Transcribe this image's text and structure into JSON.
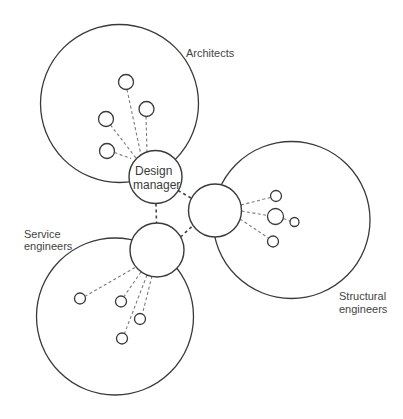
{
  "diagram": {
    "colors": {
      "stroke": "#3a3a3a",
      "dash": "#7a7a7a",
      "text": "#444444",
      "background": "#ffffff"
    },
    "groups": [
      {
        "id": "architects",
        "label_lines": [
          "Architects"
        ],
        "circle": {
          "cx": 119.5,
          "cy": 103.5,
          "r": 79
        },
        "members": [
          {
            "cx": 126,
            "cy": 82,
            "r": 7.5
          },
          {
            "cx": 146.5,
            "cy": 109,
            "r": 7.5
          },
          {
            "cx": 106,
            "cy": 119,
            "r": 7.5
          },
          {
            "cx": 107,
            "cy": 151,
            "r": 7.5
          }
        ]
      },
      {
        "id": "structural-engineers",
        "label_lines": [
          "Structural",
          "engineers"
        ],
        "circle": {
          "cx": 291.5,
          "cy": 220,
          "r": 78.5
        },
        "members": [
          {
            "cx": 276,
            "cy": 196,
            "r": 5.5
          },
          {
            "cx": 275.5,
            "cy": 216.5,
            "r": 8
          },
          {
            "cx": 294.5,
            "cy": 222,
            "r": 4.5
          },
          {
            "cx": 273,
            "cy": 241.5,
            "r": 5.5
          }
        ]
      },
      {
        "id": "service-engineers",
        "label_lines": [
          "Service",
          "engineers"
        ],
        "circle": {
          "cx": 115,
          "cy": 316.5,
          "r": 78.5
        },
        "members": [
          {
            "cx": 80,
            "cy": 298.5,
            "r": 5.5
          },
          {
            "cx": 121,
            "cy": 301.5,
            "r": 5.5
          },
          {
            "cx": 140,
            "cy": 319,
            "r": 5.5
          },
          {
            "cx": 122,
            "cy": 338.5,
            "r": 5.5
          }
        ]
      }
    ],
    "hubs": [
      {
        "id": "design-manager",
        "label_lines": [
          "Design",
          "manager"
        ],
        "cx": 155.5,
        "cy": 177,
        "r": 26.5
      },
      {
        "id": "structural-hub",
        "label_lines": [],
        "cx": 215,
        "cy": 210.5,
        "r": 26.5
      },
      {
        "id": "service-hub",
        "label_lines": [],
        "cx": 157,
        "cy": 250,
        "r": 27
      }
    ]
  }
}
